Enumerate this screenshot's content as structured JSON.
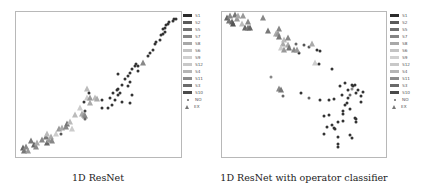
{
  "chart_data": [
    {
      "type": "scatter",
      "title": "",
      "caption": "1D ResNet",
      "xlabel": "",
      "ylabel": "",
      "axes_ticks": false,
      "grid": false,
      "legend_position": "right-outside",
      "legend": [
        "S1",
        "S2",
        "S5",
        "S7",
        "S8",
        "S6",
        "S9",
        "S12",
        "S4",
        "S11",
        "S3",
        "S10",
        "NO",
        "EX"
      ],
      "coord_note": "points given as [x%, y%] of plot frame from top-left; marker: dot=NO, tri=EX",
      "points": [
        {
          "x": 4,
          "y": 94,
          "m": "tri",
          "c": "#666"
        },
        {
          "x": 5,
          "y": 96,
          "m": "tri",
          "c": "#777"
        },
        {
          "x": 6,
          "y": 93,
          "m": "tri",
          "c": "#888"
        },
        {
          "x": 7,
          "y": 96,
          "m": "tri",
          "c": "#999"
        },
        {
          "x": 9,
          "y": 89,
          "m": "tri",
          "c": "#777"
        },
        {
          "x": 11,
          "y": 92,
          "m": "tri",
          "c": "#666"
        },
        {
          "x": 12,
          "y": 93,
          "m": "tri",
          "c": "#888"
        },
        {
          "x": 13,
          "y": 90,
          "m": "tri",
          "c": "#aaa"
        },
        {
          "x": 16,
          "y": 88,
          "m": "tri",
          "c": "#888"
        },
        {
          "x": 18,
          "y": 86,
          "m": "tri",
          "c": "#777"
        },
        {
          "x": 19,
          "y": 90,
          "m": "tri",
          "c": "#666"
        },
        {
          "x": 20,
          "y": 88,
          "m": "tri",
          "c": "#999"
        },
        {
          "x": 19,
          "y": 84,
          "m": "tri",
          "c": "#bbb"
        },
        {
          "x": 21,
          "y": 86,
          "m": "tri",
          "c": "#aaa"
        },
        {
          "x": 22,
          "y": 89,
          "m": "tri",
          "c": "#888"
        },
        {
          "x": 24,
          "y": 84,
          "m": "tri",
          "c": "#ccc"
        },
        {
          "x": 26,
          "y": 81,
          "m": "tri",
          "c": "#999"
        },
        {
          "x": 27,
          "y": 84,
          "m": "dot",
          "c": "#555"
        },
        {
          "x": 28,
          "y": 80,
          "m": "tri",
          "c": "#aaa"
        },
        {
          "x": 30,
          "y": 79,
          "m": "tri",
          "c": "#888"
        },
        {
          "x": 31,
          "y": 77,
          "m": "tri",
          "c": "#777"
        },
        {
          "x": 33,
          "y": 76,
          "m": "tri",
          "c": "#bbb"
        },
        {
          "x": 34,
          "y": 81,
          "m": "tri",
          "c": "#ccc"
        },
        {
          "x": 36,
          "y": 71,
          "m": "tri",
          "c": "#bbb"
        },
        {
          "x": 39,
          "y": 66,
          "m": "tri",
          "c": "#ccc"
        },
        {
          "x": 40,
          "y": 70,
          "m": "tri",
          "c": "#aaa"
        },
        {
          "x": 41,
          "y": 71,
          "m": "tri",
          "c": "#999"
        },
        {
          "x": 42,
          "y": 72,
          "m": "tri",
          "c": "#888"
        },
        {
          "x": 41,
          "y": 62,
          "m": "dot",
          "c": "#333"
        },
        {
          "x": 42,
          "y": 68,
          "m": "dot",
          "c": "#444"
        },
        {
          "x": 42,
          "y": 74,
          "m": "dot",
          "c": "#666"
        },
        {
          "x": 43,
          "y": 59,
          "m": "tri",
          "c": "#ccc"
        },
        {
          "x": 43,
          "y": 53,
          "m": "tri",
          "c": "#bbb"
        },
        {
          "x": 44,
          "y": 56,
          "m": "dot",
          "c": "#333"
        },
        {
          "x": 45,
          "y": 63,
          "m": "tri",
          "c": "#aaa"
        },
        {
          "x": 45,
          "y": 59,
          "m": "tri",
          "c": "#999"
        },
        {
          "x": 48,
          "y": 59,
          "m": "tri",
          "c": "#bbb"
        },
        {
          "x": 49,
          "y": 60,
          "m": "tri",
          "c": "#aaa"
        },
        {
          "x": 52,
          "y": 61,
          "m": "dot",
          "c": "#333"
        },
        {
          "x": 52,
          "y": 66,
          "m": "dot",
          "c": "#333"
        },
        {
          "x": 56,
          "y": 66,
          "m": "dot",
          "c": "#333"
        },
        {
          "x": 57,
          "y": 59,
          "m": "dot",
          "c": "#333"
        },
        {
          "x": 58,
          "y": 64,
          "m": "dot",
          "c": "#333"
        },
        {
          "x": 59,
          "y": 56,
          "m": "dot",
          "c": "#333"
        },
        {
          "x": 60,
          "y": 61,
          "m": "dot",
          "c": "#333"
        },
        {
          "x": 61,
          "y": 54,
          "m": "dot",
          "c": "#333"
        },
        {
          "x": 62,
          "y": 57,
          "m": "dot",
          "c": "#333"
        },
        {
          "x": 62,
          "y": 53,
          "m": "dot",
          "c": "#333"
        },
        {
          "x": 63,
          "y": 56,
          "m": "dot",
          "c": "#333"
        },
        {
          "x": 62,
          "y": 43,
          "m": "dot",
          "c": "#333"
        },
        {
          "x": 64,
          "y": 50,
          "m": "dot",
          "c": "#333"
        },
        {
          "x": 64,
          "y": 62,
          "m": "dot",
          "c": "#333"
        },
        {
          "x": 66,
          "y": 46,
          "m": "dot",
          "c": "#333"
        },
        {
          "x": 68,
          "y": 44,
          "m": "dot",
          "c": "#333"
        },
        {
          "x": 69,
          "y": 42,
          "m": "dot",
          "c": "#333"
        },
        {
          "x": 68,
          "y": 51,
          "m": "dot",
          "c": "#333"
        },
        {
          "x": 69,
          "y": 48,
          "m": "dot",
          "c": "#333"
        },
        {
          "x": 70,
          "y": 39,
          "m": "dot",
          "c": "#333"
        },
        {
          "x": 69,
          "y": 63,
          "m": "dot",
          "c": "#333"
        },
        {
          "x": 70,
          "y": 57,
          "m": "dot",
          "c": "#333"
        },
        {
          "x": 72,
          "y": 37,
          "m": "dot",
          "c": "#333"
        },
        {
          "x": 73,
          "y": 36,
          "m": "dot",
          "c": "#333"
        },
        {
          "x": 74,
          "y": 41,
          "m": "dot",
          "c": "#333"
        },
        {
          "x": 74,
          "y": 37,
          "m": "dot",
          "c": "#333"
        },
        {
          "x": 77,
          "y": 35,
          "m": "tri",
          "c": "#888"
        },
        {
          "x": 80,
          "y": 30,
          "m": "dot",
          "c": "#333"
        },
        {
          "x": 81,
          "y": 28,
          "m": "dot",
          "c": "#333"
        },
        {
          "x": 83,
          "y": 26,
          "m": "dot",
          "c": "#333"
        },
        {
          "x": 84,
          "y": 22,
          "m": "dot",
          "c": "#333"
        },
        {
          "x": 85,
          "y": 21,
          "m": "dot",
          "c": "#333"
        },
        {
          "x": 87,
          "y": 19,
          "m": "dot",
          "c": "#333"
        },
        {
          "x": 88,
          "y": 16,
          "m": "dot",
          "c": "#333"
        },
        {
          "x": 89,
          "y": 15,
          "m": "dot",
          "c": "#333"
        },
        {
          "x": 89,
          "y": 12,
          "m": "dot",
          "c": "#333"
        },
        {
          "x": 90,
          "y": 11,
          "m": "dot",
          "c": "#333"
        },
        {
          "x": 90,
          "y": 14,
          "m": "dot",
          "c": "#333"
        },
        {
          "x": 91,
          "y": 9,
          "m": "dot",
          "c": "#333"
        },
        {
          "x": 92,
          "y": 8,
          "m": "dot",
          "c": "#333"
        },
        {
          "x": 93,
          "y": 7,
          "m": "dot",
          "c": "#333"
        },
        {
          "x": 95,
          "y": 6,
          "m": "dot",
          "c": "#333"
        },
        {
          "x": 96,
          "y": 5,
          "m": "dot",
          "c": "#333"
        },
        {
          "x": 97,
          "y": 5,
          "m": "dot",
          "c": "#333"
        }
      ]
    },
    {
      "type": "scatter",
      "title": "",
      "caption": "1D ResNet with operator classifier",
      "xlabel": "",
      "ylabel": "",
      "axes_ticks": false,
      "grid": false,
      "legend_position": "right-outside",
      "legend": [
        "S1",
        "S2",
        "S5",
        "S7",
        "S8",
        "S6",
        "S9",
        "S12",
        "S4",
        "S11",
        "S3",
        "S10",
        "NO",
        "EX"
      ],
      "coord_note": "points given as [x%, y%] of plot frame from top-left; marker: dot=NO, tri=EX",
      "points": [
        {
          "x": 3,
          "y": 4,
          "m": "tri",
          "c": "#666"
        },
        {
          "x": 4,
          "y": 6,
          "m": "tri",
          "c": "#777"
        },
        {
          "x": 5,
          "y": 3,
          "m": "tri",
          "c": "#888"
        },
        {
          "x": 6,
          "y": 7,
          "m": "tri",
          "c": "#666"
        },
        {
          "x": 7,
          "y": 8,
          "m": "tri",
          "c": "#555"
        },
        {
          "x": 8,
          "y": 2,
          "m": "tri",
          "c": "#777"
        },
        {
          "x": 9,
          "y": 5,
          "m": "tri",
          "c": "#999"
        },
        {
          "x": 10,
          "y": 3,
          "m": "tri",
          "c": "#aaa"
        },
        {
          "x": 12,
          "y": 8,
          "m": "tri",
          "c": "#bbb"
        },
        {
          "x": 13,
          "y": 3,
          "m": "tri",
          "c": "#999"
        },
        {
          "x": 14,
          "y": 11,
          "m": "tri",
          "c": "#666"
        },
        {
          "x": 16,
          "y": 11,
          "m": "tri",
          "c": "#777"
        },
        {
          "x": 16,
          "y": 7,
          "m": "tri",
          "c": "#888"
        },
        {
          "x": 17,
          "y": 11,
          "m": "tri",
          "c": "#666"
        },
        {
          "x": 25,
          "y": 4,
          "m": "tri",
          "c": "#888"
        },
        {
          "x": 28,
          "y": 13,
          "m": "tri",
          "c": "#777"
        },
        {
          "x": 33,
          "y": 15,
          "m": "tri",
          "c": "#aaa"
        },
        {
          "x": 34,
          "y": 15,
          "m": "tri",
          "c": "#999"
        },
        {
          "x": 35,
          "y": 12,
          "m": "tri",
          "c": "#888"
        },
        {
          "x": 35,
          "y": 17,
          "m": "tri",
          "c": "#777"
        },
        {
          "x": 37,
          "y": 22,
          "m": "tri",
          "c": "#aaa"
        },
        {
          "x": 38,
          "y": 19,
          "m": "tri",
          "c": "#bbb"
        },
        {
          "x": 40,
          "y": 18,
          "m": "tri",
          "c": "#888"
        },
        {
          "x": 40,
          "y": 23,
          "m": "tri",
          "c": "#aaa"
        },
        {
          "x": 36,
          "y": 25,
          "m": "tri",
          "c": "#ccc"
        },
        {
          "x": 38,
          "y": 26,
          "m": "tri",
          "c": "#999"
        },
        {
          "x": 41,
          "y": 25,
          "m": "tri",
          "c": "#777"
        },
        {
          "x": 44,
          "y": 26,
          "m": "tri",
          "c": "#888"
        },
        {
          "x": 45,
          "y": 22,
          "m": "dot",
          "c": "#666"
        },
        {
          "x": 47,
          "y": 28,
          "m": "dot",
          "c": "#333"
        },
        {
          "x": 46,
          "y": 26,
          "m": "tri",
          "c": "#999"
        },
        {
          "x": 50,
          "y": 23,
          "m": "dot",
          "c": "#555"
        },
        {
          "x": 53,
          "y": 24,
          "m": "dot",
          "c": "#555"
        },
        {
          "x": 55,
          "y": 22,
          "m": "tri",
          "c": "#aaa"
        },
        {
          "x": 58,
          "y": 26,
          "m": "dot",
          "c": "#333"
        },
        {
          "x": 60,
          "y": 27,
          "m": "dot",
          "c": "#333"
        },
        {
          "x": 57,
          "y": 35,
          "m": "tri",
          "c": "#ccc"
        },
        {
          "x": 59,
          "y": 36,
          "m": "dot",
          "c": "#333"
        },
        {
          "x": 67,
          "y": 39,
          "m": "dot",
          "c": "#333"
        },
        {
          "x": 30,
          "y": 45,
          "m": "dot",
          "c": "#888"
        },
        {
          "x": 35,
          "y": 53,
          "m": "tri",
          "c": "#888"
        },
        {
          "x": 36,
          "y": 54,
          "m": "tri",
          "c": "#777"
        },
        {
          "x": 37,
          "y": 58,
          "m": "dot",
          "c": "#666"
        },
        {
          "x": 48,
          "y": 56,
          "m": "dot",
          "c": "#333"
        },
        {
          "x": 53,
          "y": 59,
          "m": "dot",
          "c": "#666"
        },
        {
          "x": 60,
          "y": 61,
          "m": "dot",
          "c": "#333"
        },
        {
          "x": 65,
          "y": 61,
          "m": "dot",
          "c": "#333"
        },
        {
          "x": 68,
          "y": 60,
          "m": "dot",
          "c": "#333"
        },
        {
          "x": 72,
          "y": 51,
          "m": "dot",
          "c": "#333"
        },
        {
          "x": 73,
          "y": 57,
          "m": "dot",
          "c": "#333"
        },
        {
          "x": 75,
          "y": 49,
          "m": "dot",
          "c": "#333"
        },
        {
          "x": 77,
          "y": 54,
          "m": "dot",
          "c": "#333"
        },
        {
          "x": 77,
          "y": 59,
          "m": "dot",
          "c": "#333"
        },
        {
          "x": 79,
          "y": 50,
          "m": "dot",
          "c": "#333"
        },
        {
          "x": 80,
          "y": 51,
          "m": "dot",
          "c": "#333"
        },
        {
          "x": 81,
          "y": 50,
          "m": "dot",
          "c": "#333"
        },
        {
          "x": 79,
          "y": 53,
          "m": "dot",
          "c": "#888"
        },
        {
          "x": 78,
          "y": 57,
          "m": "dot",
          "c": "#666"
        },
        {
          "x": 82,
          "y": 56,
          "m": "dot",
          "c": "#333"
        },
        {
          "x": 83,
          "y": 54,
          "m": "dot",
          "c": "#333"
        },
        {
          "x": 85,
          "y": 58,
          "m": "dot",
          "c": "#333"
        },
        {
          "x": 86,
          "y": 55,
          "m": "dot",
          "c": "#333"
        },
        {
          "x": 85,
          "y": 62,
          "m": "dot",
          "c": "#333"
        },
        {
          "x": 75,
          "y": 64,
          "m": "dot",
          "c": "#333"
        },
        {
          "x": 76,
          "y": 63,
          "m": "dot",
          "c": "#333"
        },
        {
          "x": 78,
          "y": 67,
          "m": "dot",
          "c": "#333"
        },
        {
          "x": 74,
          "y": 68,
          "m": "dot",
          "c": "#333"
        },
        {
          "x": 74,
          "y": 70,
          "m": "dot",
          "c": "#333"
        },
        {
          "x": 62,
          "y": 72,
          "m": "dot",
          "c": "#333"
        },
        {
          "x": 65,
          "y": 71,
          "m": "dot",
          "c": "#333"
        },
        {
          "x": 71,
          "y": 76,
          "m": "dot",
          "c": "#333"
        },
        {
          "x": 74,
          "y": 75,
          "m": "dot",
          "c": "#333"
        },
        {
          "x": 81,
          "y": 73,
          "m": "dot",
          "c": "#333"
        },
        {
          "x": 82,
          "y": 74,
          "m": "dot",
          "c": "#333"
        },
        {
          "x": 82,
          "y": 76,
          "m": "dot",
          "c": "#333"
        },
        {
          "x": 64,
          "y": 79,
          "m": "dot",
          "c": "#333"
        },
        {
          "x": 67,
          "y": 78,
          "m": "dot",
          "c": "#333"
        },
        {
          "x": 68,
          "y": 80,
          "m": "dot",
          "c": "#333"
        },
        {
          "x": 69,
          "y": 81,
          "m": "dot",
          "c": "#333"
        },
        {
          "x": 62,
          "y": 84,
          "m": "dot",
          "c": "#333"
        },
        {
          "x": 71,
          "y": 86,
          "m": "dot",
          "c": "#333"
        },
        {
          "x": 78,
          "y": 85,
          "m": "dot",
          "c": "#333"
        },
        {
          "x": 79,
          "y": 87,
          "m": "dot",
          "c": "#333"
        },
        {
          "x": 71,
          "y": 91,
          "m": "dot",
          "c": "#333"
        },
        {
          "x": 71,
          "y": 93,
          "m": "dot",
          "c": "#333"
        }
      ]
    }
  ],
  "legend_items": [
    {
      "label": "S1",
      "color": "#2b2b2b",
      "kind": "swatch"
    },
    {
      "label": "S2",
      "color": "#5a5a5a",
      "kind": "swatch"
    },
    {
      "label": "S5",
      "color": "#6f6f6f",
      "kind": "swatch"
    },
    {
      "label": "S7",
      "color": "#858585",
      "kind": "swatch"
    },
    {
      "label": "S8",
      "color": "#a8a8a8",
      "kind": "swatch"
    },
    {
      "label": "S6",
      "color": "#c4c4c4",
      "kind": "swatch"
    },
    {
      "label": "S9",
      "color": "#d0d0d0",
      "kind": "swatch"
    },
    {
      "label": "S12",
      "color": "#c8c8c8",
      "kind": "swatch"
    },
    {
      "label": "S4",
      "color": "#b5b5b5",
      "kind": "swatch"
    },
    {
      "label": "S11",
      "color": "#8c8c8c",
      "kind": "swatch"
    },
    {
      "label": "S3",
      "color": "#6a6a6a",
      "kind": "swatch"
    },
    {
      "label": "S10",
      "color": "#4a4a4a",
      "kind": "swatch"
    },
    {
      "label": "NO",
      "color": "#666666",
      "kind": "dot"
    },
    {
      "label": "EX",
      "color": "#777777",
      "kind": "tri"
    }
  ],
  "captions": {
    "left": "1D ResNet",
    "right": "1D ResNet with operator classifier"
  }
}
